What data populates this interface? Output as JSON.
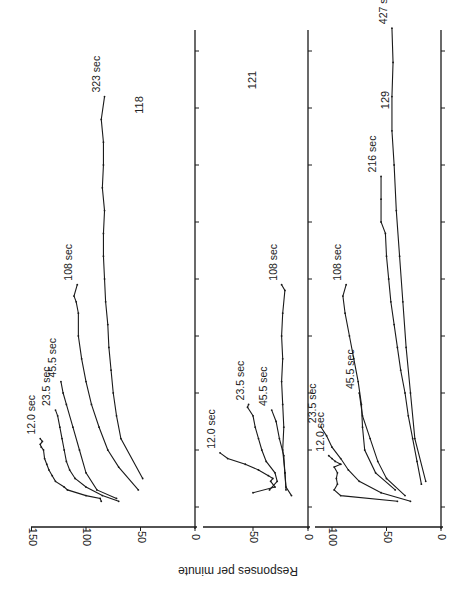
{
  "chart_data": {
    "type": "line",
    "orientation_note": "figure printed rotated 90 degrees counter-clockwise; time axis runs upward, response-rate axis runs horizontally",
    "ylabel": "Responses per minute",
    "xlabel": "",
    "x_tick_count": 9,
    "line_color": "#1a1a1a",
    "panels": [
      {
        "id": "118",
        "label": "118",
        "ylim": [
          0,
          150
        ],
        "yticks": [
          0,
          50,
          100,
          150
        ],
        "series": [
          {
            "name": "12.0 sec",
            "label": "12.0 sec",
            "x": [
              0.1,
              0.15,
              0.2,
              0.3,
              0.35,
              0.45,
              0.55,
              0.65,
              0.75,
              0.85,
              1.0,
              1.05,
              1.1,
              1.15,
              1.2
            ],
            "y": [
              86,
              87,
              100,
              117,
              120,
              128,
              131,
              134,
              136,
              138,
              139,
              141,
              142,
              140,
              142
            ]
          },
          {
            "name": "23.5 sec",
            "label": "23.5 sec",
            "x": [
              0.1,
              0.2,
              0.35,
              0.5,
              0.65,
              0.8,
              1.0,
              1.2,
              1.4,
              1.6,
              1.7
            ],
            "y": [
              70,
              85,
              100,
              110,
              115,
              118,
              120,
              122,
              124,
              126,
              128
            ]
          },
          {
            "name": "45.5 sec",
            "label": "45.5 sec",
            "x": [
              0.15,
              0.3,
              0.6,
              1.0,
              1.4,
              1.8,
              2.0,
              2.2
            ],
            "y": [
              72,
              90,
              100,
              106,
              112,
              118,
              121,
              123
            ]
          },
          {
            "name": "108 sec",
            "label": "108 sec",
            "x": [
              0.3,
              0.7,
              1.0,
              1.4,
              1.8,
              2.2,
              2.6,
              3.0,
              3.4,
              3.6,
              3.7,
              3.9
            ],
            "y": [
              52,
              70,
              80,
              88,
              95,
              100,
              104,
              107,
              107,
              109,
              111,
              108
            ]
          },
          {
            "name": "323 sec",
            "label": "323 sec",
            "x": [
              0.5,
              1.2,
              1.6,
              2.0,
              2.4,
              2.8,
              3.2,
              3.6,
              4.0,
              4.4,
              4.8,
              5.2,
              5.6,
              6.0,
              6.4,
              6.8,
              7.2
            ],
            "y": [
              48,
              68,
              72,
              75,
              77,
              79,
              80,
              82,
              83,
              84,
              84,
              83,
              85,
              84,
              84,
              86,
              83
            ]
          }
        ]
      },
      {
        "id": "121",
        "label": "121",
        "ylim": [
          0,
          85
        ],
        "yticks": [
          0,
          50
        ],
        "series": [
          {
            "name": "12.0 sec",
            "label": "12.0 sec",
            "x": [
              0.25,
              0.35,
              0.45,
              0.5,
              0.55,
              0.65,
              0.75,
              0.85,
              0.95
            ],
            "y": [
              50,
              30,
              34,
              32,
              36,
              45,
              57,
              73,
              80
            ]
          },
          {
            "name": "23.5 sec",
            "label": "23.5 sec",
            "x": [
              0.3,
              0.45,
              0.6,
              0.8,
              1.0,
              1.2,
              1.4,
              1.6,
              1.75,
              1.8
            ],
            "y": [
              35,
              28,
              30,
              38,
              42,
              45,
              48,
              50,
              55,
              54
            ]
          },
          {
            "name": "45.5 sec",
            "label": "45.5 sec",
            "x": [
              0.2,
              0.35,
              0.6,
              0.9,
              1.2,
              1.5,
              1.7
            ],
            "y": [
              15,
              20,
              21,
              22,
              26,
              29,
              33
            ]
          },
          {
            "name": "108 sec",
            "label": "108 sec",
            "x": [
              0.3,
              0.6,
              1.0,
              1.4,
              1.8,
              2.2,
              2.6,
              3.0,
              3.4,
              3.8,
              3.9
            ],
            "y": [
              20,
              21,
              23,
              22,
              23,
              24,
              23,
              24,
              23,
              21,
              24
            ]
          }
        ]
      },
      {
        "id": "129",
        "label": "129",
        "ylim": [
          0,
          110
        ],
        "yticks": [
          0,
          50,
          100
        ],
        "series": [
          {
            "name": "12.0 sec",
            "label": "12.0 sec",
            "x": [
              0.1,
              0.2,
              0.3,
              0.4,
              0.5,
              0.6,
              0.7,
              0.75,
              0.8,
              0.85,
              0.9
            ],
            "y": [
              40,
              92,
              98,
              95,
              96,
              95,
              98,
              92,
              97,
              100,
              103
            ]
          },
          {
            "name": "23.5 sec",
            "label": "23.5 sec",
            "x": [
              0.1,
              0.25,
              0.45,
              0.65,
              0.85,
              1.05,
              1.25,
              1.4
            ],
            "y": [
              28,
              55,
              75,
              85,
              92,
              100,
              105,
              110
            ]
          },
          {
            "name": "45.5 sec",
            "label": "45.5 sec",
            "x": [
              0.2,
              0.5,
              0.8,
              1.2,
              1.6,
              2.0
            ],
            "y": [
              33,
              50,
              58,
              65,
              72,
              75
            ]
          },
          {
            "name": "108 sec",
            "label": "108 sec",
            "x": [
              0.3,
              0.6,
              1.0,
              1.4,
              1.8,
              2.2,
              2.6,
              3.0,
              3.4,
              3.7,
              3.9
            ],
            "y": [
              42,
              60,
              70,
              72,
              73,
              76,
              80,
              84,
              88,
              90,
              87
            ]
          },
          {
            "name": "216 sec",
            "label": "216 sec",
            "x": [
              0.4,
              0.8,
              1.2,
              1.6,
              2.0,
              2.4,
              2.8,
              3.2,
              3.6,
              4.0,
              4.4,
              4.8,
              5.0,
              5.4,
              5.8
            ],
            "y": [
              18,
              22,
              26,
              30,
              33,
              37,
              40,
              43,
              46,
              48,
              50,
              51,
              55,
              55,
              55
            ]
          },
          {
            "name": "427 sec",
            "label": "427 sec",
            "x": [
              0.45,
              1.2,
              2.0,
              2.8,
              3.6,
              4.4,
              5.2,
              6.0,
              6.6,
              7.2,
              7.8,
              8.4
            ],
            "y": [
              14,
              24,
              28,
              32,
              35,
              38,
              41,
              43,
              45,
              45,
              44,
              45
            ]
          }
        ]
      }
    ]
  }
}
